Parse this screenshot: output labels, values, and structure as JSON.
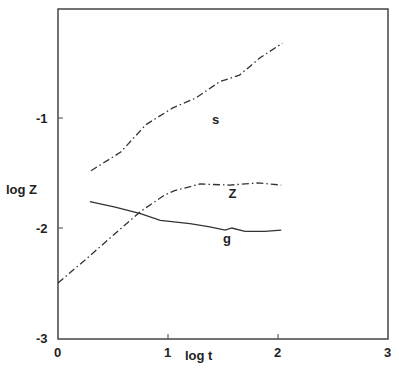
{
  "chart_data": {
    "type": "line",
    "title": "",
    "xlabel": "log t",
    "ylabel": "log Z",
    "xlim": [
      0,
      3
    ],
    "ylim": [
      -3,
      0
    ],
    "grid": false,
    "legend": "inline curve labels",
    "x_ticks": [
      "0",
      "1",
      "2",
      "3"
    ],
    "y_ticks": [
      "-1",
      "-2",
      "-3"
    ],
    "series": [
      {
        "name": "s",
        "style": "dash-dot",
        "x": [
          0.3,
          0.57,
          0.8,
          1.04,
          1.25,
          1.47,
          1.65,
          1.84,
          2.04
        ],
        "y": [
          -1.48,
          -1.31,
          -1.06,
          -0.91,
          -0.82,
          -0.67,
          -0.61,
          -0.45,
          -0.32
        ]
      },
      {
        "name": "Z",
        "style": "dash-dot",
        "x": [
          0.0,
          0.27,
          0.52,
          0.75,
          0.97,
          1.06,
          1.29,
          1.56,
          1.82,
          2.03
        ],
        "y": [
          -2.5,
          -2.27,
          -2.05,
          -1.85,
          -1.7,
          -1.66,
          -1.6,
          -1.61,
          -1.59,
          -1.61
        ]
      },
      {
        "name": "g",
        "style": "solid",
        "x": [
          0.29,
          0.52,
          0.75,
          0.93,
          1.2,
          1.38,
          1.52,
          1.58,
          1.7,
          1.88,
          2.03
        ],
        "y": [
          -1.76,
          -1.81,
          -1.87,
          -1.93,
          -1.96,
          -1.99,
          -2.02,
          -2.0,
          -2.03,
          -2.03,
          -2.02
        ]
      }
    ],
    "annotations": [
      {
        "text": "s",
        "x": 1.4,
        "y": -1.05
      },
      {
        "text": "Z",
        "x": 1.55,
        "y": -1.73
      },
      {
        "text": "g",
        "x": 1.5,
        "y": -2.14
      }
    ]
  }
}
